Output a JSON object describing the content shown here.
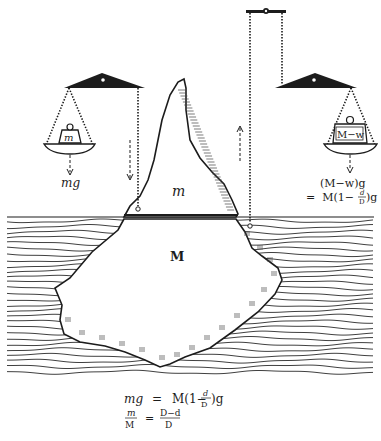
{
  "figure": {
    "colors": {
      "ink": "#1c1c1c",
      "paper": "#ffffff",
      "water_lines": "#2a2a2a"
    }
  },
  "left_balance": {
    "weight_label": "m",
    "force_label": "mg"
  },
  "right_balance": {
    "weight_label": "M−w",
    "force_line1": "(M−w)g",
    "force_line2_prefix": "=  M(1−",
    "force_line2_num": "d",
    "force_line2_den": "D",
    "force_line2_suffix": ")g"
  },
  "iceberg": {
    "above_water_label": "m",
    "below_water_label": "M"
  },
  "equations": {
    "eq1_lhs": "mg",
    "eq1_eq": "=",
    "eq1_rhs_prefix": "M(1−",
    "eq1_rhs_num": "d",
    "eq1_rhs_den": "D",
    "eq1_rhs_suffix": ")g",
    "eq2_lhs_num": "m",
    "eq2_lhs_den": "M",
    "eq2_eq": "=",
    "eq2_rhs_num": "D−d",
    "eq2_rhs_den": "D"
  }
}
